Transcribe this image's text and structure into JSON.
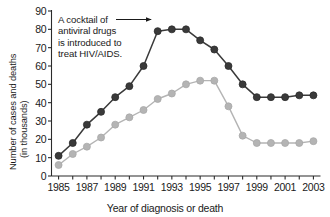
{
  "chart_data": {
    "type": "line",
    "title": "",
    "xlabel": "Year of diagnosis or death",
    "ylabel": "Number of cases and deaths (in thousands)",
    "ylabel_line1": "Number of cases and deaths",
    "ylabel_line2": "(in thousands)",
    "ylim": [
      0,
      90
    ],
    "ytick_values": [
      0,
      10,
      20,
      30,
      40,
      50,
      60,
      70,
      80,
      90
    ],
    "ytick_labels": [
      "0",
      "10",
      "20",
      "30",
      "40",
      "50",
      "60",
      "70",
      "80",
      "90"
    ],
    "grid": false,
    "legend": "none",
    "x": [
      1985,
      1986,
      1987,
      1988,
      1989,
      1990,
      1991,
      1992,
      1993,
      1994,
      1995,
      1996,
      1997,
      1998,
      1999,
      2000,
      2001,
      2002,
      2003
    ],
    "xtick_labels": [
      "1985",
      "1987",
      "1989",
      "1991",
      "1993",
      "1995",
      "1997",
      "1999",
      "2001",
      "2003"
    ],
    "xtick_label_values": [
      1985,
      1987,
      1989,
      1991,
      1993,
      1995,
      1997,
      1999,
      2001,
      2003
    ],
    "xlim": [
      1984.5,
      2003.5
    ],
    "series": [
      {
        "name": "cases",
        "color": "#3a3a3a",
        "marker": "circle",
        "values": [
          11,
          18,
          28,
          35,
          43,
          49,
          60,
          79,
          80,
          80,
          74,
          69,
          60,
          50,
          43,
          43,
          43,
          44,
          44
        ]
      },
      {
        "name": "deaths",
        "color": "#b4b4b4",
        "marker": "circle",
        "values": [
          6,
          12,
          16,
          21,
          28,
          32,
          36,
          42,
          45,
          50,
          52,
          52,
          38,
          22,
          18,
          18,
          18,
          18,
          19
        ]
      }
    ],
    "annotations": [
      {
        "name": "antiviral-cocktail-note",
        "lines": [
          "A cocktail of",
          "antiviral drugs",
          "is introduced to",
          "treat HIV/AIDS."
        ],
        "arrow_to_year": 1992,
        "arrow_to_value": 79
      }
    ]
  },
  "colors": {
    "axis": "#2b2b2b",
    "series_cases": "#3a3a3a",
    "series_deaths": "#b4b4b4",
    "background": "#ffffff",
    "text": "#1a1a1a"
  }
}
